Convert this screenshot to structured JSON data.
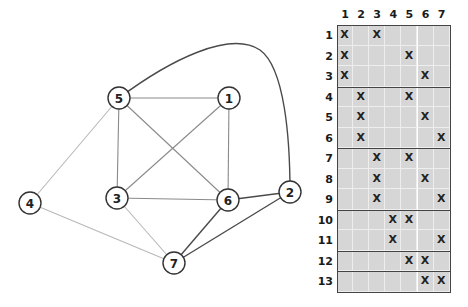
{
  "graph": {
    "nodes": [
      {
        "id": "1",
        "x": 229,
        "y": 98
      },
      {
        "id": "2",
        "x": 290,
        "y": 192
      },
      {
        "id": "3",
        "x": 117,
        "y": 198
      },
      {
        "id": "4",
        "x": 30,
        "y": 203
      },
      {
        "id": "5",
        "x": 119,
        "y": 98
      },
      {
        "id": "6",
        "x": 228,
        "y": 200
      },
      {
        "id": "7",
        "x": 174,
        "y": 263
      }
    ],
    "edges": [
      {
        "from": "5",
        "to": "1",
        "tone": "mid"
      },
      {
        "from": "5",
        "to": "3",
        "tone": "mid"
      },
      {
        "from": "5",
        "to": "6",
        "tone": "mid"
      },
      {
        "from": "5",
        "to": "4",
        "tone": "light"
      },
      {
        "from": "5",
        "to": "2",
        "tone": "dark",
        "curve": true
      },
      {
        "from": "1",
        "to": "3",
        "tone": "mid"
      },
      {
        "from": "1",
        "to": "6",
        "tone": "mid"
      },
      {
        "from": "3",
        "to": "6",
        "tone": "mid"
      },
      {
        "from": "3",
        "to": "7",
        "tone": "light"
      },
      {
        "from": "4",
        "to": "7",
        "tone": "light"
      },
      {
        "from": "6",
        "to": "2",
        "tone": "dark"
      },
      {
        "from": "6",
        "to": "7",
        "tone": "dark"
      },
      {
        "from": "7",
        "to": "2",
        "tone": "dark"
      }
    ],
    "colors": {
      "light": "#b8b8b8",
      "mid": "#8a8a8a",
      "dark": "#4a4a4a",
      "node_stroke": "#333333"
    }
  },
  "matrix": {
    "columns": [
      "1",
      "2",
      "3",
      "4",
      "5",
      "6",
      "7"
    ],
    "rows": [
      {
        "label": "1",
        "marks": [
          1,
          3
        ]
      },
      {
        "label": "2",
        "marks": [
          1,
          5
        ]
      },
      {
        "label": "3",
        "marks": [
          1,
          6
        ]
      },
      {
        "label": "4",
        "marks": [
          2,
          5
        ]
      },
      {
        "label": "5",
        "marks": [
          2,
          6
        ]
      },
      {
        "label": "6",
        "marks": [
          2,
          7
        ]
      },
      {
        "label": "7",
        "marks": [
          3,
          5
        ]
      },
      {
        "label": "8",
        "marks": [
          3,
          6
        ]
      },
      {
        "label": "9",
        "marks": [
          3,
          7
        ]
      },
      {
        "label": "10",
        "marks": [
          4,
          5
        ]
      },
      {
        "label": "11",
        "marks": [
          4,
          7
        ]
      },
      {
        "label": "12",
        "marks": [
          5,
          6
        ]
      },
      {
        "label": "13",
        "marks": [
          6,
          7
        ]
      }
    ],
    "groups": [
      [
        1,
        3
      ],
      [
        4,
        6
      ],
      [
        7,
        9
      ],
      [
        10,
        11
      ],
      [
        12,
        12
      ],
      [
        13,
        13
      ]
    ],
    "mark_symbol": "X",
    "cell_color": "#d6d6d6"
  }
}
